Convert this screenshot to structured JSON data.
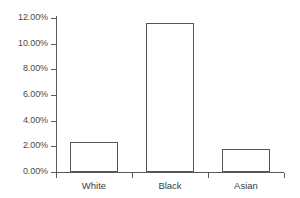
{
  "chart_data": {
    "type": "bar",
    "title": "",
    "subtitle": "",
    "xlabel": "",
    "ylabel": "",
    "categories": [
      "White",
      "Black",
      "Asian"
    ],
    "values": [
      2.3,
      11.6,
      1.8
    ],
    "value_labels": [
      "2.30%",
      "11.60%",
      "1.80%"
    ],
    "ylim": [
      0,
      12
    ],
    "ytick_values": [
      0,
      2,
      4,
      6,
      8,
      10,
      12
    ],
    "ytick_labels": [
      "0.00%",
      "2.00%",
      "4.00%",
      "6.00%",
      "8.00%",
      "10.00%",
      "12.00%"
    ],
    "grid": false,
    "legend": false,
    "legend_position": "none",
    "series": [
      {
        "name": "",
        "values": [
          2.3,
          11.6,
          1.8
        ]
      }
    ],
    "style": {
      "bar_fill": "#ffffff",
      "bar_outline": "#555555",
      "axis_color": "#5a5a5a",
      "tick_label_color": "#4a4a4a",
      "category_label_color": "#3c3c3c",
      "background": "#ffffff"
    }
  }
}
